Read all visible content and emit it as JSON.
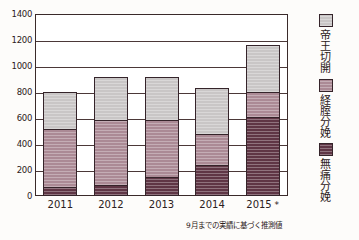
{
  "chart_data": {
    "type": "bar",
    "stacked": true,
    "title": "",
    "subtitle": "",
    "xlabel": "",
    "ylabel": "",
    "categories": [
      "2011",
      "2012",
      "2013",
      "2014",
      "2015*"
    ],
    "ylim": [
      0,
      1400
    ],
    "ytick_values": [
      0,
      200,
      400,
      600,
      800,
      1000,
      1200,
      1400
    ],
    "ytick_labels": [
      "0",
      "200",
      "400",
      "600",
      "800",
      "1000",
      "1200",
      "1400"
    ],
    "grid": true,
    "legend_position": "right",
    "series": [
      {
        "name": "無痛分娩",
        "color": "#5f3645",
        "values": [
          70,
          85,
          145,
          240,
          610
        ]
      },
      {
        "name": "経腟分娩",
        "color": "#ab8a95",
        "values": [
          460,
          510,
          450,
          250,
          200
        ]
      },
      {
        "name": "帝王切開",
        "color": "#c9c6c6",
        "values": [
          295,
          345,
          340,
          360,
          375
        ]
      }
    ],
    "totals": [
      825,
      940,
      935,
      850,
      1185
    ],
    "annotations": [
      "9月までの実績に基づく推測値"
    ]
  },
  "footnote": "9月までの実績に基づく推測値",
  "colors": {
    "caesarean": "#c9c6c6",
    "vaginal": "#ab8a95",
    "painless": "#5f3645",
    "axis": "#3a2a2a",
    "background": "#fdfcfa"
  }
}
